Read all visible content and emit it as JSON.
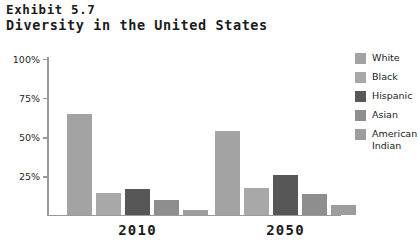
{
  "title": {
    "line1": "Exhibit 5.7",
    "line2": "Diversity in the United States"
  },
  "legend": {
    "items": [
      {
        "label": "White",
        "color": "#a3a3a3"
      },
      {
        "label": "Black",
        "color": "#a8a8a8"
      },
      {
        "label": "Hispanic",
        "color": "#575757"
      },
      {
        "label": "Asian",
        "color": "#8e8e8e"
      },
      {
        "label": "American\nIndian",
        "color": "#9d9d9d"
      }
    ]
  },
  "axis": {
    "y_ticks": [
      "100%",
      "75%",
      "50%",
      "25%"
    ],
    "y_tick_values": [
      100,
      75,
      50,
      25
    ]
  },
  "chart_data": {
    "type": "bar",
    "title": "Diversity in the United States",
    "subtitle": "Exhibit 5.7",
    "xlabel": "",
    "ylabel": "",
    "ylim": [
      0,
      100
    ],
    "grid": false,
    "legend_position": "right",
    "categories": [
      "2010",
      "2050"
    ],
    "series": [
      {
        "name": "White",
        "color": "#a3a3a3",
        "values": [
          64,
          53
        ]
      },
      {
        "name": "Black",
        "color": "#a8a8a8",
        "values": [
          14,
          17
        ]
      },
      {
        "name": "Hispanic",
        "color": "#575757",
        "values": [
          16,
          25
        ]
      },
      {
        "name": "Asian",
        "color": "#8e8e8e",
        "values": [
          9,
          13
        ]
      },
      {
        "name": "American Indian",
        "color": "#9d9d9d",
        "values": [
          3,
          6
        ]
      }
    ],
    "ytick_labels": [
      "25%",
      "50%",
      "75%",
      "100%"
    ]
  }
}
